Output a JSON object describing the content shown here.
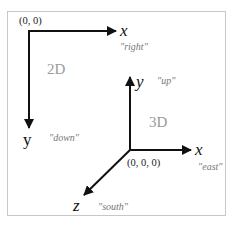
{
  "diagram": {
    "frame": {
      "border_color": "#c8c8c8"
    },
    "colors": {
      "axis": "#111111",
      "hint": "#777777",
      "dimension_label": "#9a9a9a"
    },
    "two_d": {
      "dimension_label": "2D",
      "origin_label": "(0, 0)",
      "x_axis": {
        "label": "x",
        "direction": "\"right\""
      },
      "y_axis": {
        "label": "y",
        "direction": "\"down\""
      }
    },
    "three_d": {
      "dimension_label": "3D",
      "origin_label": "(0, 0, 0)",
      "x_axis": {
        "label": "x",
        "direction": "\"east\""
      },
      "y_axis": {
        "label": "y",
        "direction": "\"up\""
      },
      "z_axis": {
        "label": "z",
        "direction": "\"south\""
      }
    }
  }
}
